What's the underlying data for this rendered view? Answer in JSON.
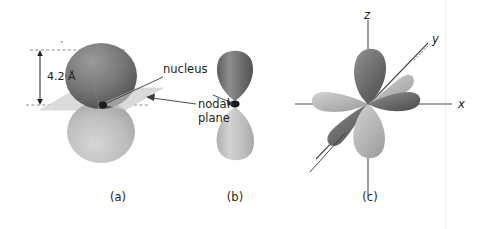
{
  "figure": {
    "type": "orbital-diagram",
    "background": "#ffffff",
    "ink": "#231f20",
    "lobe_dark": "#6e6e6e",
    "lobe_light": "#b9b9b9",
    "nodal_plane_fill": "#d8d8d8",
    "axis_color": "#3a3a3a"
  },
  "panels": [
    {
      "id": "a",
      "caption": "(a)",
      "caption_x": 118,
      "dimension": {
        "text": "4.2 Å",
        "value": 4.2,
        "unit": "Å"
      },
      "annotations": [
        {
          "name": "nucleus",
          "text": "nucleus"
        },
        {
          "name": "nodal-plane",
          "text": "nodal\nplane",
          "line1": "nodal",
          "line2": "plane"
        }
      ]
    },
    {
      "id": "b",
      "caption": "(b)",
      "caption_x": 235
    },
    {
      "id": "c",
      "caption": "(c)",
      "caption_x": 370,
      "axes": [
        {
          "name": "z",
          "label": "z"
        },
        {
          "name": "y",
          "label": "y"
        },
        {
          "name": "x",
          "label": "x"
        }
      ]
    }
  ]
}
